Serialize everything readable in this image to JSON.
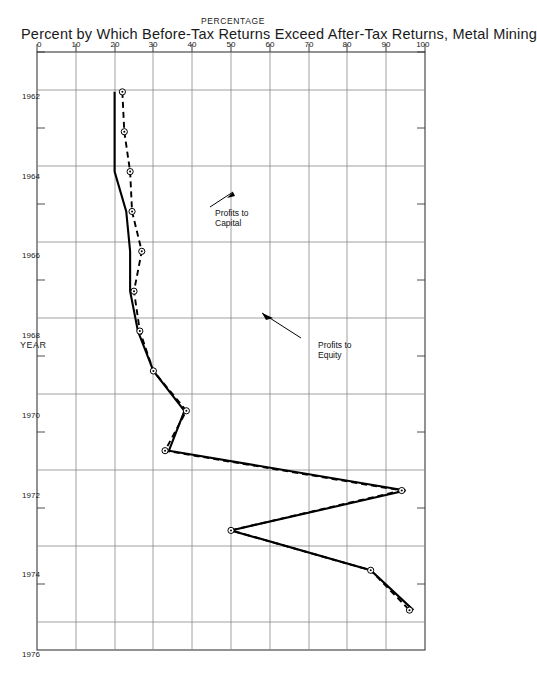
{
  "figure": {
    "title": "Percent by Which Before-Tax Returns Exceed After-Tax Returns, Metal Mining",
    "orientation": "rotated-90-clockwise"
  },
  "axes": {
    "x_axis_title": "YEAR",
    "y_axis_title": "PERCENTAGE",
    "x_tick_labels": [
      "1962",
      "1964",
      "1966",
      "1968",
      "1970",
      "1972",
      "1974",
      "1976"
    ],
    "y_tick_labels": [
      "0",
      "10",
      "20",
      "30",
      "40",
      "50",
      "60",
      "70",
      "80",
      "90",
      "100"
    ]
  },
  "annotations": [
    {
      "id": "profits-to-capital",
      "line1": "Profits to",
      "line2": "Capital"
    },
    {
      "id": "profits-to-equity",
      "line1": "Profits to",
      "line2": "Equity"
    }
  ],
  "chart_data": {
    "type": "line",
    "title": "Percent by Which Before-Tax Returns Exceed After-Tax Returns, Metal Mining",
    "xlabel": "YEAR",
    "ylabel": "PERCENTAGE",
    "xlim": [
      1961,
      1976
    ],
    "ylim": [
      0,
      100
    ],
    "x_ticks": [
      1962,
      1964,
      1966,
      1968,
      1970,
      1972,
      1974,
      1976
    ],
    "y_ticks": [
      0,
      10,
      20,
      30,
      40,
      50,
      60,
      70,
      80,
      90,
      100
    ],
    "grid": true,
    "legend": "annotated-inline",
    "x": [
      1962,
      1963,
      1964,
      1965,
      1966,
      1967,
      1968,
      1969,
      1970,
      1971,
      1972,
      1973,
      1974,
      1975
    ],
    "series": [
      {
        "name": "Profits to Capital",
        "style": "solid",
        "markers": false,
        "values": [
          20,
          20,
          20,
          23,
          24,
          24,
          26,
          30,
          38,
          34,
          95,
          50,
          86,
          97
        ]
      },
      {
        "name": "Profits to Equity",
        "style": "dashed",
        "markers": true,
        "values": [
          22,
          22.5,
          24,
          24.5,
          27,
          25,
          26.5,
          30,
          38.5,
          33,
          94,
          50,
          86,
          96
        ]
      }
    ]
  }
}
